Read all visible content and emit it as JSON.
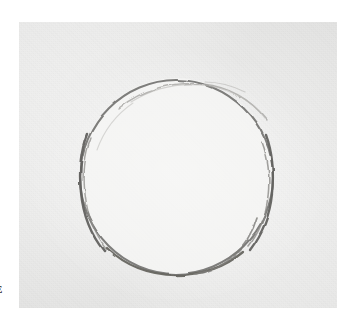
{
  "figure": {
    "medium": "graphite pencil on paper",
    "canvas": {
      "width_px": 349,
      "height_px": 328,
      "page_background": "#ffffff"
    },
    "photo_plate": {
      "name": "scanned-photo-plate",
      "left_px": 19,
      "top_px": 22,
      "width_px": 318,
      "height_px": 286,
      "fill_color": "#eeeeed",
      "interior_highlight_color": "#f5f5f4",
      "texture": "fine paper grain"
    },
    "circle": {
      "name": "hand-drawn-circle",
      "center_x_px": 176,
      "center_y_px": 177,
      "radius_px": 95,
      "bounding_box": {
        "left_px": 82,
        "top_px": 80,
        "right_px": 270,
        "bottom_px": 274
      },
      "stroke_color_dark": "#6b6a68",
      "stroke_color_light": "#a9a8a5",
      "stroke_width_px": 2,
      "quality": "sketchy, slightly irregular, overlapping graphite strokes",
      "notes": [
        "doubled stroke on left flank",
        "doubled stroke on right flank",
        "overlapping strokes at lower-right",
        "lighter thinner arc across the top"
      ]
    },
    "edge_glyph": {
      "name": "clipped-caption-glyph",
      "text": "E",
      "left_px": 1,
      "top_px": 284,
      "color": "#1d1d1d",
      "note": "partial character clipped by the crop at the left margin"
    }
  }
}
